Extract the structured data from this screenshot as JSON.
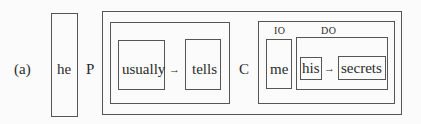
{
  "figure_label": "(a)",
  "subject": {
    "word": "he"
  },
  "predicate": {
    "marker": "P",
    "modifier": "usually",
    "verb": "tells",
    "arrow": "→"
  },
  "complement": {
    "marker": "C",
    "indirect_object": {
      "tag": "IO",
      "word": "me"
    },
    "direct_object": {
      "tag": "DO",
      "determiner": "his",
      "noun": "secrets",
      "arrow": "→"
    }
  }
}
